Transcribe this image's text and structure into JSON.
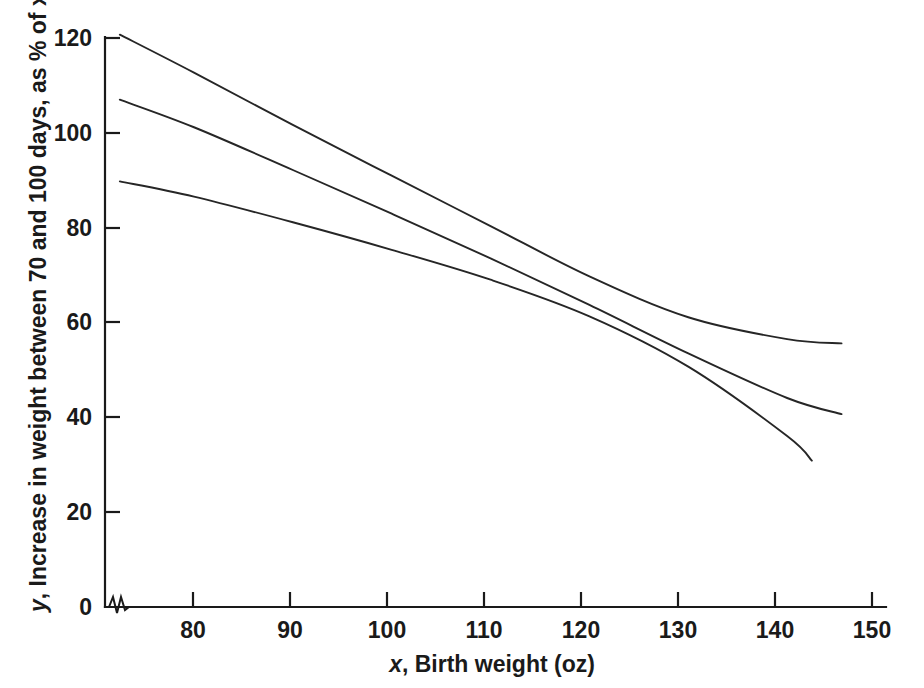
{
  "chart_data": {
    "type": "line",
    "title": "",
    "subtitle": "",
    "xlabel_prefix": "x",
    "xlabel_rest": ", Birth weight (oz)",
    "xlabel": "x, Birth weight (oz)",
    "ylabel_prefix": "y",
    "ylabel_rest": ", Increase in weight between 70 and 100 days, as % of x",
    "ylabel": "y, Increase in weight between 70 and 100 days, as % of x",
    "xlim": [
      71,
      150
    ],
    "ylim": [
      0,
      120
    ],
    "xticks": [
      80,
      90,
      100,
      110,
      120,
      130,
      140,
      150
    ],
    "xticklabels": [
      "80",
      "90",
      "100",
      "110",
      "120",
      "130",
      "140",
      "150"
    ],
    "yticks": [
      0,
      20,
      40,
      60,
      80,
      100,
      120
    ],
    "yticklabels": [
      "0",
      "20",
      "40",
      "60",
      "80",
      "100",
      "120"
    ],
    "origin_label": "0",
    "grid": false,
    "legend": "none",
    "axis_break": "x-axis zigzag break between 0 and first plotted value",
    "line_color": "#262626",
    "axis_color": "#1a1a1a",
    "background_color": "#ffffff",
    "series": [
      {
        "name": "upper band",
        "x": [
          72.5,
          80,
          90,
          100,
          110,
          120,
          130,
          140,
          145.5
        ],
        "y": [
          120.5,
          112.5,
          101.5,
          90.8,
          80.2,
          69.6,
          61.0,
          56.4,
          55.5
        ]
      },
      {
        "name": "central line",
        "x": [
          72.5,
          80,
          90,
          100,
          110,
          120,
          130,
          140,
          145.5
        ],
        "y": [
          106.8,
          101.0,
          92.0,
          82.8,
          73.4,
          63.6,
          53.4,
          44.0,
          40.6
        ]
      },
      {
        "name": "lower band",
        "x": [
          72.5,
          80,
          90,
          100,
          110,
          120,
          130,
          140,
          142.5
        ],
        "y": [
          89.6,
          86.4,
          81.0,
          75.2,
          68.9,
          61.2,
          50.6,
          36.0,
          30.8
        ]
      }
    ],
    "series_count": 3
  }
}
